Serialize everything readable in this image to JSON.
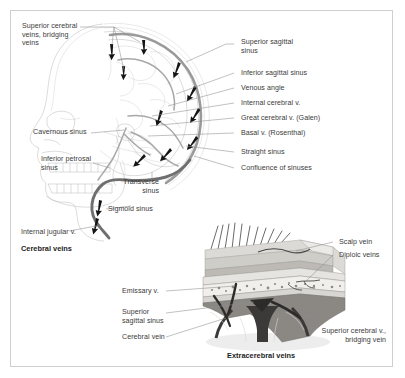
{
  "figure": {
    "panels": [
      {
        "caption": "Cerebral veins"
      },
      {
        "caption": "Extracerebral veins"
      }
    ]
  },
  "cerebral_panel": {
    "caption": "Cerebral veins",
    "labels_left": [
      {
        "text": "Superior cerebral\nveins, bridging\nveins"
      },
      {
        "text": "Cavernous sinus"
      },
      {
        "text": "Inferior petrosal\nsinus"
      },
      {
        "text": "Transverse\nsinus"
      },
      {
        "text": "Sigmoid sinus"
      },
      {
        "text": "Internal jugular v."
      }
    ],
    "labels_right": [
      {
        "text": "Superior sagittal\nsinus"
      },
      {
        "text": "Inferior sagittal sinus"
      },
      {
        "text": "Venous angle"
      },
      {
        "text": "Internal cerebral v."
      },
      {
        "text": "Great cerebral v. (Galen)"
      },
      {
        "text": "Basal v. (Rosenthal)"
      },
      {
        "text": "Straight sinus"
      },
      {
        "text": "Confluence of sinuses"
      }
    ]
  },
  "extracerebral_panel": {
    "caption": "Extracerebral veins",
    "labels_left": [
      {
        "text": "Emissary v."
      },
      {
        "text": "Superior\nsagittal sinus"
      },
      {
        "text": "Cerebral vein"
      }
    ],
    "labels_right": [
      {
        "text": "Scalp vein"
      },
      {
        "text": "Diploic veins"
      },
      {
        "text": "Superior cerebral v.,\nbridging vein"
      }
    ]
  },
  "colors": {
    "background": "#ffffff",
    "frame": "#cfcfcf",
    "text": "#3b3b3b",
    "caption": "#1d1d1d",
    "leader": "#8d8d8d",
    "sinus": "#9a9a9a",
    "sinus_dark": "#6f6f6f",
    "arrow": "#151515"
  }
}
